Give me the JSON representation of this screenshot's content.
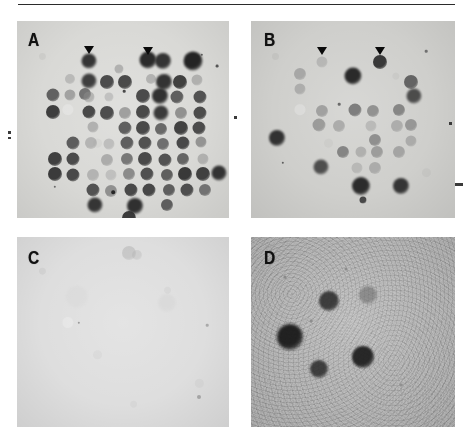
{
  "figure": {
    "kind": "autoradiograph-dot-blot-figure",
    "width": 470,
    "height": 446,
    "rule_color": "#2b2b2b"
  },
  "panels": [
    {
      "id": "A",
      "label": "A",
      "background_color": "#d9d9d6",
      "description": "dense dot blot grid with many dark hybridization signals",
      "arrowheads": [
        {
          "x": 72,
          "y": 25
        },
        {
          "x": 131,
          "y": 26
        }
      ],
      "spots": [
        {
          "x": 72,
          "y": 40,
          "r": 7.5,
          "c": "#2d2d2d",
          "o": 0.95
        },
        {
          "x": 131,
          "y": 39,
          "r": 8.5,
          "c": "#242424",
          "o": 0.96
        },
        {
          "x": 146,
          "y": 40,
          "r": 8.0,
          "c": "#2a2a2a",
          "o": 0.94
        },
        {
          "x": 176,
          "y": 40,
          "r": 9.5,
          "c": "#1f1f1f",
          "o": 0.97
        },
        {
          "x": 102,
          "y": 48,
          "r": 4.5,
          "c": "#8e8e8e",
          "o": 0.55
        },
        {
          "x": 53,
          "y": 58,
          "r": 5.0,
          "c": "#9a9a9a",
          "o": 0.5
        },
        {
          "x": 72,
          "y": 60,
          "r": 7.5,
          "c": "#333333",
          "o": 0.93
        },
        {
          "x": 90,
          "y": 61,
          "r": 7.0,
          "c": "#3d3d3d",
          "o": 0.9
        },
        {
          "x": 108,
          "y": 61,
          "r": 7.0,
          "c": "#3a3a3a",
          "o": 0.9
        },
        {
          "x": 134,
          "y": 58,
          "r": 5.0,
          "c": "#8a8a8a",
          "o": 0.5
        },
        {
          "x": 147,
          "y": 61,
          "r": 8.0,
          "c": "#2b2b2b",
          "o": 0.95
        },
        {
          "x": 163,
          "y": 61,
          "r": 7.0,
          "c": "#333333",
          "o": 0.92
        },
        {
          "x": 180,
          "y": 59,
          "r": 5.5,
          "c": "#888888",
          "o": 0.5
        },
        {
          "x": 36,
          "y": 74,
          "r": 6.5,
          "c": "#4d4d4d",
          "o": 0.85
        },
        {
          "x": 53,
          "y": 74,
          "r": 5.5,
          "c": "#7d7d7d",
          "o": 0.6
        },
        {
          "x": 68,
          "y": 73,
          "r": 6.0,
          "c": "#5a5a5a",
          "o": 0.8
        },
        {
          "x": 72,
          "y": 76,
          "r": 5.5,
          "c": "#8c8c8c",
          "o": 0.5
        },
        {
          "x": 92,
          "y": 76,
          "r": 4.5,
          "c": "#a0a0a0",
          "o": 0.45
        },
        {
          "x": 126,
          "y": 75,
          "r": 7.0,
          "c": "#3c3c3c",
          "o": 0.9
        },
        {
          "x": 143,
          "y": 75,
          "r": 8.0,
          "c": "#282828",
          "o": 0.95
        },
        {
          "x": 160,
          "y": 76,
          "r": 6.5,
          "c": "#4a4a4a",
          "o": 0.85
        },
        {
          "x": 183,
          "y": 76,
          "r": 6.5,
          "c": "#3f3f3f",
          "o": 0.88
        },
        {
          "x": 36,
          "y": 91,
          "r": 7.0,
          "c": "#333333",
          "o": 0.93
        },
        {
          "x": 72,
          "y": 91,
          "r": 6.5,
          "c": "#3a3a3a",
          "o": 0.9
        },
        {
          "x": 90,
          "y": 92,
          "r": 7.0,
          "c": "#3e3e3e",
          "o": 0.9
        },
        {
          "x": 108,
          "y": 92,
          "r": 6.0,
          "c": "#7a7a7a",
          "o": 0.62
        },
        {
          "x": 126,
          "y": 91,
          "r": 7.0,
          "c": "#3a3a3a",
          "o": 0.9
        },
        {
          "x": 144,
          "y": 92,
          "r": 7.5,
          "c": "#2e2e2e",
          "o": 0.93
        },
        {
          "x": 164,
          "y": 92,
          "r": 6.0,
          "c": "#6f6f6f",
          "o": 0.68
        },
        {
          "x": 183,
          "y": 92,
          "r": 6.5,
          "c": "#3d3d3d",
          "o": 0.9
        },
        {
          "x": 76,
          "y": 106,
          "r": 5.5,
          "c": "#8a8a8a",
          "o": 0.52
        },
        {
          "x": 108,
          "y": 107,
          "r": 6.5,
          "c": "#4a4a4a",
          "o": 0.85
        },
        {
          "x": 126,
          "y": 107,
          "r": 7.0,
          "c": "#3a3a3a",
          "o": 0.9
        },
        {
          "x": 144,
          "y": 108,
          "r": 6.0,
          "c": "#505050",
          "o": 0.82
        },
        {
          "x": 164,
          "y": 107,
          "r": 7.0,
          "c": "#363636",
          "o": 0.92
        },
        {
          "x": 182,
          "y": 107,
          "r": 6.5,
          "c": "#3c3c3c",
          "o": 0.9
        },
        {
          "x": 56,
          "y": 122,
          "r": 6.5,
          "c": "#484848",
          "o": 0.85
        },
        {
          "x": 74,
          "y": 122,
          "r": 6.0,
          "c": "#8e8e8e",
          "o": 0.5
        },
        {
          "x": 92,
          "y": 123,
          "r": 5.5,
          "c": "#9a9a9a",
          "o": 0.45
        },
        {
          "x": 110,
          "y": 122,
          "r": 6.5,
          "c": "#4a4a4a",
          "o": 0.85
        },
        {
          "x": 128,
          "y": 122,
          "r": 6.5,
          "c": "#3e3e3e",
          "o": 0.88
        },
        {
          "x": 146,
          "y": 123,
          "r": 6.0,
          "c": "#555555",
          "o": 0.8
        },
        {
          "x": 166,
          "y": 122,
          "r": 6.5,
          "c": "#3a3a3a",
          "o": 0.9
        },
        {
          "x": 184,
          "y": 121,
          "r": 5.5,
          "c": "#707070",
          "o": 0.65
        },
        {
          "x": 38,
          "y": 138,
          "r": 7.0,
          "c": "#343434",
          "o": 0.92
        },
        {
          "x": 56,
          "y": 138,
          "r": 6.5,
          "c": "#3c3c3c",
          "o": 0.9
        },
        {
          "x": 90,
          "y": 139,
          "r": 6.0,
          "c": "#868686",
          "o": 0.55
        },
        {
          "x": 110,
          "y": 138,
          "r": 6.0,
          "c": "#5c5c5c",
          "o": 0.78
        },
        {
          "x": 128,
          "y": 138,
          "r": 7.0,
          "c": "#3a3a3a",
          "o": 0.9
        },
        {
          "x": 148,
          "y": 139,
          "r": 6.5,
          "c": "#404040",
          "o": 0.88
        },
        {
          "x": 166,
          "y": 138,
          "r": 6.0,
          "c": "#4e4e4e",
          "o": 0.83
        },
        {
          "x": 186,
          "y": 138,
          "r": 5.5,
          "c": "#8a8a8a",
          "o": 0.5
        },
        {
          "x": 38,
          "y": 153,
          "r": 7.0,
          "c": "#303030",
          "o": 0.93
        },
        {
          "x": 56,
          "y": 154,
          "r": 6.5,
          "c": "#3a3a3a",
          "o": 0.9
        },
        {
          "x": 76,
          "y": 154,
          "r": 6.0,
          "c": "#8e8e8e",
          "o": 0.5
        },
        {
          "x": 94,
          "y": 154,
          "r": 5.5,
          "c": "#9c9c9c",
          "o": 0.42
        },
        {
          "x": 112,
          "y": 153,
          "r": 6.0,
          "c": "#6a6a6a",
          "o": 0.7
        },
        {
          "x": 130,
          "y": 153,
          "r": 6.5,
          "c": "#3e3e3e",
          "o": 0.88
        },
        {
          "x": 150,
          "y": 154,
          "r": 6.0,
          "c": "#4a4a4a",
          "o": 0.85
        },
        {
          "x": 168,
          "y": 153,
          "r": 7.0,
          "c": "#2e2e2e",
          "o": 0.93
        },
        {
          "x": 186,
          "y": 153,
          "r": 7.0,
          "c": "#343434",
          "o": 0.92
        },
        {
          "x": 202,
          "y": 152,
          "r": 7.5,
          "c": "#2a2a2a",
          "o": 0.94
        },
        {
          "x": 76,
          "y": 169,
          "r": 6.5,
          "c": "#404040",
          "o": 0.88
        },
        {
          "x": 94,
          "y": 170,
          "r": 6.0,
          "c": "#6e6e6e",
          "o": 0.68
        },
        {
          "x": 114,
          "y": 169,
          "r": 6.5,
          "c": "#3a3a3a",
          "o": 0.9
        },
        {
          "x": 132,
          "y": 169,
          "r": 6.5,
          "c": "#383838",
          "o": 0.9
        },
        {
          "x": 152,
          "y": 169,
          "r": 6.0,
          "c": "#4a4a4a",
          "o": 0.85
        },
        {
          "x": 170,
          "y": 169,
          "r": 6.5,
          "c": "#3c3c3c",
          "o": 0.88
        },
        {
          "x": 188,
          "y": 169,
          "r": 6.0,
          "c": "#585858",
          "o": 0.78
        },
        {
          "x": 78,
          "y": 184,
          "r": 7.5,
          "c": "#2c2c2c",
          "o": 0.94
        },
        {
          "x": 118,
          "y": 185,
          "r": 8.0,
          "c": "#282828",
          "o": 0.95
        },
        {
          "x": 150,
          "y": 184,
          "r": 6.0,
          "c": "#4a4a4a",
          "o": 0.85
        },
        {
          "x": 112,
          "y": 197,
          "r": 7.0,
          "c": "#303030",
          "o": 0.93
        }
      ],
      "specks": [
        {
          "x": 96,
          "y": 171,
          "r": 1.8,
          "c": "#262626"
        },
        {
          "x": 200,
          "y": 45,
          "r": 1.4,
          "c": "#555555"
        },
        {
          "x": 185,
          "y": 34,
          "r": 1.2,
          "c": "#5a5a5a"
        },
        {
          "x": 38,
          "y": 166,
          "r": 1.2,
          "c": "#6a6a6a"
        },
        {
          "x": 107,
          "y": 70,
          "r": 1.3,
          "c": "#4a4a4a"
        }
      ]
    },
    {
      "id": "B",
      "label": "B",
      "background_color": "#cfcfcc",
      "description": "sparse dot blot with fewer and fainter hybridization signals",
      "arrowheads": [
        {
          "x": 71,
          "y": 26
        },
        {
          "x": 129,
          "y": 26
        }
      ],
      "spots": [
        {
          "x": 71,
          "y": 41,
          "r": 5.5,
          "c": "#9a9a9a",
          "o": 0.48
        },
        {
          "x": 129,
          "y": 41,
          "r": 7.0,
          "c": "#2e2e2e",
          "o": 0.93
        },
        {
          "x": 49,
          "y": 53,
          "r": 6.0,
          "c": "#888888",
          "o": 0.56
        },
        {
          "x": 102,
          "y": 55,
          "r": 8.5,
          "c": "#242424",
          "o": 0.96
        },
        {
          "x": 49,
          "y": 68,
          "r": 5.5,
          "c": "#8e8e8e",
          "o": 0.52
        },
        {
          "x": 160,
          "y": 61,
          "r": 7.0,
          "c": "#4a4a4a",
          "o": 0.8
        },
        {
          "x": 163,
          "y": 75,
          "r": 7.5,
          "c": "#3a3a3a",
          "o": 0.88
        },
        {
          "x": 71,
          "y": 90,
          "r": 6.0,
          "c": "#808080",
          "o": 0.6
        },
        {
          "x": 104,
          "y": 89,
          "r": 6.5,
          "c": "#606060",
          "o": 0.74
        },
        {
          "x": 122,
          "y": 90,
          "r": 6.0,
          "c": "#707070",
          "o": 0.66
        },
        {
          "x": 148,
          "y": 89,
          "r": 6.0,
          "c": "#666666",
          "o": 0.7
        },
        {
          "x": 68,
          "y": 104,
          "r": 6.5,
          "c": "#7a7a7a",
          "o": 0.62
        },
        {
          "x": 88,
          "y": 105,
          "r": 6.0,
          "c": "#8a8a8a",
          "o": 0.54
        },
        {
          "x": 120,
          "y": 105,
          "r": 5.5,
          "c": "#9a9a9a",
          "o": 0.45
        },
        {
          "x": 146,
          "y": 105,
          "r": 6.0,
          "c": "#8c8c8c",
          "o": 0.52
        },
        {
          "x": 160,
          "y": 104,
          "r": 6.0,
          "c": "#777777",
          "o": 0.64
        },
        {
          "x": 26,
          "y": 117,
          "r": 8.0,
          "c": "#2a2a2a",
          "o": 0.95
        },
        {
          "x": 124,
          "y": 119,
          "r": 6.0,
          "c": "#707070",
          "o": 0.68
        },
        {
          "x": 160,
          "y": 120,
          "r": 5.5,
          "c": "#8a8a8a",
          "o": 0.52
        },
        {
          "x": 92,
          "y": 131,
          "r": 6.0,
          "c": "#686868",
          "o": 0.72
        },
        {
          "x": 110,
          "y": 131,
          "r": 5.5,
          "c": "#8e8e8e",
          "o": 0.5
        },
        {
          "x": 126,
          "y": 131,
          "r": 6.0,
          "c": "#7a7a7a",
          "o": 0.6
        },
        {
          "x": 148,
          "y": 131,
          "r": 6.0,
          "c": "#828282",
          "o": 0.56
        },
        {
          "x": 70,
          "y": 146,
          "r": 7.5,
          "c": "#3c3c3c",
          "o": 0.88
        },
        {
          "x": 106,
          "y": 147,
          "r": 5.5,
          "c": "#9a9a9a",
          "o": 0.45
        },
        {
          "x": 124,
          "y": 147,
          "r": 6.0,
          "c": "#8a8a8a",
          "o": 0.52
        },
        {
          "x": 110,
          "y": 165,
          "r": 9.0,
          "c": "#262626",
          "o": 0.96
        },
        {
          "x": 150,
          "y": 165,
          "r": 8.0,
          "c": "#2c2c2c",
          "o": 0.94
        },
        {
          "x": 112,
          "y": 179,
          "r": 3.5,
          "c": "#3a3a3a",
          "o": 0.9
        }
      ],
      "specks": [
        {
          "x": 88,
          "y": 83,
          "r": 1.3,
          "c": "#6a6a6a"
        },
        {
          "x": 32,
          "y": 142,
          "r": 1.2,
          "c": "#5e5e5e"
        },
        {
          "x": 175,
          "y": 30,
          "r": 1.3,
          "c": "#707070"
        }
      ]
    },
    {
      "id": "C",
      "label": "C",
      "background_color": "#dedede",
      "description": "blank negative control panel with faint smudge near top center",
      "arrowheads": [],
      "spots": [
        {
          "x": 112,
          "y": 16,
          "r": 7.0,
          "c": "#9e9e9e",
          "o": 0.35
        },
        {
          "x": 120,
          "y": 18,
          "r": 5.0,
          "c": "#a8a8a8",
          "o": 0.28
        },
        {
          "x": 150,
          "y": 66,
          "r": 9.0,
          "c": "#cdcdcd",
          "o": 0.3
        },
        {
          "x": 60,
          "y": 60,
          "r": 11.0,
          "c": "#d2d2d2",
          "o": 0.28
        }
      ],
      "specks": [
        {
          "x": 62,
          "y": 86,
          "r": 1.2,
          "c": "#9a9a9a"
        },
        {
          "x": 182,
          "y": 160,
          "r": 2.0,
          "c": "#a4a4a4"
        },
        {
          "x": 190,
          "y": 88,
          "r": 1.3,
          "c": "#aaaaaa"
        }
      ]
    },
    {
      "id": "D",
      "label": "D",
      "background_color": "#b2b2b2",
      "description": "grainy panel with five discrete dark hybridization spots",
      "arrowheads": [],
      "spots": [
        {
          "x": 39,
          "y": 100,
          "r": 13.0,
          "c": "#1a1a1a",
          "o": 0.95
        },
        {
          "x": 78,
          "y": 64,
          "r": 10.0,
          "c": "#303030",
          "o": 0.9
        },
        {
          "x": 117,
          "y": 58,
          "r": 9.0,
          "c": "#6e6e6e",
          "o": 0.6
        },
        {
          "x": 68,
          "y": 132,
          "r": 9.0,
          "c": "#2e2e2e",
          "o": 0.88
        },
        {
          "x": 112,
          "y": 120,
          "r": 11.0,
          "c": "#1f1f1f",
          "o": 0.94
        }
      ],
      "specks": [
        {
          "x": 34,
          "y": 40,
          "r": 1.6,
          "c": "#8a8a8a"
        },
        {
          "x": 60,
          "y": 84,
          "r": 1.4,
          "c": "#8e8e8e"
        },
        {
          "x": 95,
          "y": 32,
          "r": 1.5,
          "c": "#8c8c8c"
        },
        {
          "x": 150,
          "y": 148,
          "r": 1.4,
          "c": "#909090"
        }
      ]
    }
  ],
  "edge_marks": [
    {
      "x": 8,
      "y": 131,
      "w": 3,
      "h": 3
    },
    {
      "x": 8,
      "y": 137,
      "w": 3,
      "h": 2
    },
    {
      "x": 455,
      "y": 183,
      "w": 8,
      "h": 3
    },
    {
      "x": 234,
      "y": 116,
      "w": 3,
      "h": 3
    },
    {
      "x": 449,
      "y": 122,
      "w": 3,
      "h": 3
    }
  ]
}
